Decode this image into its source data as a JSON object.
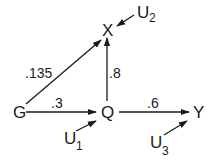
{
  "diagram": {
    "type": "path-diagram",
    "nodes": {
      "G": {
        "label": "G"
      },
      "Q": {
        "label": "Q"
      },
      "X": {
        "label": "X"
      },
      "Y": {
        "label": "Y"
      },
      "U1": {
        "label": "U",
        "subscript": "1"
      },
      "U2": {
        "label": "U",
        "subscript": "2"
      },
      "U3": {
        "label": "U",
        "subscript": "3"
      }
    },
    "edges": {
      "G_X": {
        "from": "G",
        "to": "X",
        "label": ".135"
      },
      "G_Q": {
        "from": "G",
        "to": "Q",
        "label": ".3"
      },
      "Q_X": {
        "from": "Q",
        "to": "X",
        "label": ".8"
      },
      "Q_Y": {
        "from": "Q",
        "to": "Y",
        "label": ".6"
      },
      "U1_Q": {
        "from": "U1",
        "to": "Q",
        "label": ""
      },
      "U2_X": {
        "from": "U2",
        "to": "X",
        "label": ""
      },
      "U3_Y": {
        "from": "U3",
        "to": "Y",
        "label": ""
      }
    },
    "color": "#1a1a1a"
  }
}
